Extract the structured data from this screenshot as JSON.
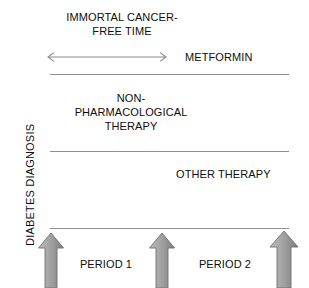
{
  "figure": {
    "background_color": "#ffffff",
    "text_color": "#0d0d0d",
    "rule_color": "#8f8f8f",
    "arrow_fill_light": "#b3b3b3",
    "arrow_fill_dark": "#7e7e7e",
    "arrow_stroke": "#6e6e6e"
  },
  "axis_label": {
    "text": "DIABETES DIAGNOSIS"
  },
  "immortal_time": {
    "line1": "IMMORTAL CANCER-",
    "line2": "FREE TIME"
  },
  "treatment_bands": [
    {
      "name": "metformin",
      "label": "METFORMIN"
    },
    {
      "name": "non-pharmacological-therapy",
      "line1": "NON-",
      "line2": "PHARMACOLOGICAL",
      "line3": "THERAPY"
    },
    {
      "name": "other-therapy",
      "label": "OTHER THERAPY"
    }
  ],
  "periods": [
    {
      "label": "PERIOD 1"
    },
    {
      "label": "PERIOD 2"
    }
  ],
  "icons": {
    "double_headed_arrow": "double-headed-horizontal-arrow",
    "up_arrow": "up-arrow"
  }
}
